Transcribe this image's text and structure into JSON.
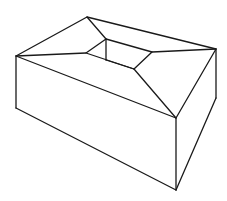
{
  "figure": {
    "stroke_color": "#1a1a1a",
    "background": "#ffffff",
    "vertices": {
      "outer_back_left": [
        87,
        17
      ],
      "outer_back_right": [
        216,
        49
      ],
      "outer_front_right": [
        176,
        118
      ],
      "outer_front_left": [
        16,
        56
      ],
      "inner_back_left": [
        106,
        39
      ],
      "inner_back_right": [
        152,
        52
      ],
      "inner_front_right": [
        134,
        69
      ],
      "inner_front_left": [
        86,
        53
      ],
      "inner_wall_bottom": [
        106,
        60
      ],
      "bottom_front_left": [
        16,
        108
      ],
      "bottom_front_right": [
        176,
        190
      ],
      "bottom_back_right": [
        216,
        98
      ]
    }
  }
}
